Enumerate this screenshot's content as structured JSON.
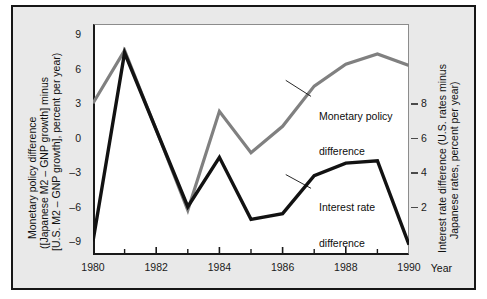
{
  "chart_data": {
    "type": "line",
    "title": "",
    "xlabel": "Year",
    "ylabel": "Monetary policy difference ([Japanese M2 – GNP growth] minus [U.S. M2 – GNP growth], percent per year)",
    "ylabel_right": "Interest rate difference (U.S. rates minus Japanese rates, percent per year)",
    "x": [
      1980,
      1981,
      1982,
      1983,
      1984,
      1985,
      1986,
      1987,
      1988,
      1989,
      1990
    ],
    "xlim": [
      1980,
      1990
    ],
    "ylim": [
      -10.2,
      9.9
    ],
    "ylim_right": [
      -1.4,
      9.3
    ],
    "grid": false,
    "legend_position": "inline-annotations",
    "xticks_major": [
      "1980",
      "1982",
      "1984",
      "1986",
      "1988",
      "1990"
    ],
    "xticks_major_values": [
      1980,
      1982,
      1984,
      1986,
      1988,
      1990
    ],
    "xticks_minor_values": [
      1981,
      1983,
      1985,
      1987,
      1989
    ],
    "yticks_left": [
      "9",
      "6",
      "3",
      "0",
      "-3",
      "-6",
      "-9"
    ],
    "yticks_left_values": [
      9,
      6,
      3,
      0,
      -3,
      -6,
      -9
    ],
    "yticks_right": [
      "8",
      "6",
      "4",
      "2"
    ],
    "yticks_right_values": [
      8,
      6,
      4,
      2
    ],
    "series": [
      {
        "name": "Monetary policy difference",
        "color": "#808080",
        "axis": "left",
        "values": [
          3.0,
          7.6,
          0.7,
          -6.3,
          2.3,
          -1.3,
          1.0,
          4.5,
          6.4,
          7.3,
          6.3
        ]
      },
      {
        "name": "Interest rate difference",
        "color": "#121212",
        "axis": "right",
        "values_left_scale": [
          -9.0,
          7.4,
          0.7,
          -6.0,
          -1.7,
          -7.1,
          -6.6,
          -3.3,
          -2.2,
          -2.0,
          -9.3
        ],
        "values": [
          0.2,
          9.0,
          5.4,
          1.9,
          4.2,
          1.4,
          1.6,
          3.1,
          3.7,
          3.8,
          0.0
        ]
      }
    ],
    "annotations": [
      {
        "text": "Monetary policy\ndifference",
        "target_year": 1986.6,
        "target_value_left": 4.5
      },
      {
        "text": "Interest rate\ndifference",
        "target_year": 1986.6,
        "target_value_left": -3.5
      }
    ]
  },
  "axis_captions": {
    "left_line1": "Monetary policy difference",
    "left_line2": "([Japanese M2 – GNP growth] minus",
    "left_line3": "[U.S. M2 – GNP growth], percent per year)",
    "right_line1": "Interest rate difference (U.S. rates minus",
    "right_line2": "Japanese rates, percent per year)",
    "x_caption": "Year"
  },
  "annotation_labels": {
    "monetary_l1": "Monetary policy",
    "monetary_l2": "difference",
    "interest_l1": "Interest rate",
    "interest_l2": "difference"
  },
  "colors": {
    "background": "#e9e9e9",
    "plot_background": "#ffffff",
    "frame": "#161616",
    "monetary_series": "#808080",
    "interest_series": "#121212",
    "text": "#111111"
  }
}
